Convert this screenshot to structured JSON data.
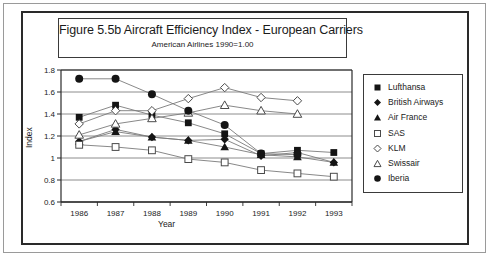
{
  "figure": {
    "title": "Figure 5.5b  Aircraft Efficiency Index - European Carriers",
    "subtitle": "American Airlines 1990=1.00"
  },
  "axes": {
    "ylabel": "Index",
    "xlabel": "Year",
    "yticks": [
      "1.8",
      "1.6",
      "1.4",
      "1.2",
      "1",
      "0.8",
      "0.6"
    ],
    "xticks": [
      "1986",
      "1987",
      "1988",
      "1989",
      "1990",
      "1991",
      "1992",
      "1993"
    ]
  },
  "legend": {
    "items": [
      {
        "label": "Lufthansa",
        "marker": "filled-square-marker"
      },
      {
        "label": "British Airways",
        "marker": "filled-diamond-marker"
      },
      {
        "label": "Air France",
        "marker": "filled-triangle-marker"
      },
      {
        "label": "SAS",
        "marker": "open-square-marker"
      },
      {
        "label": "KLM",
        "marker": "open-diamond-marker"
      },
      {
        "label": "Swissair",
        "marker": "open-triangle-marker"
      },
      {
        "label": "Iberia",
        "marker": "filled-circle-marker"
      }
    ]
  },
  "chart_data": {
    "type": "line",
    "title": "Figure 5.5b  Aircraft Efficiency Index - European Carriers",
    "subtitle": "American Airlines 1990=1.00",
    "xlabel": "Year",
    "ylabel": "Index",
    "categories": [
      1986,
      1987,
      1988,
      1989,
      1990,
      1991,
      1992,
      1993
    ],
    "ylim": [
      0.6,
      1.8
    ],
    "ytick_step": 0.2,
    "grid": "horizontal",
    "legend_position": "right",
    "series": [
      {
        "name": "Lufthansa",
        "marker": "filled-square",
        "values": [
          1.37,
          1.48,
          1.39,
          1.32,
          1.22,
          1.04,
          1.07,
          1.05
        ]
      },
      {
        "name": "British Airways",
        "marker": "filled-diamond",
        "values": [
          1.15,
          1.26,
          1.19,
          1.16,
          1.17,
          1.02,
          1.05,
          0.96
        ]
      },
      {
        "name": "Air France",
        "marker": "filled-triangle",
        "values": [
          1.15,
          1.24,
          1.19,
          1.16,
          1.1,
          1.03,
          1.01,
          0.96
        ]
      },
      {
        "name": "SAS",
        "marker": "open-square",
        "values": [
          1.12,
          1.1,
          1.07,
          0.99,
          0.96,
          0.89,
          0.86,
          0.83
        ]
      },
      {
        "name": "KLM",
        "marker": "open-diamond",
        "values": [
          1.31,
          1.43,
          1.43,
          1.54,
          1.64,
          1.55,
          1.52,
          null
        ]
      },
      {
        "name": "Swissair",
        "marker": "open-triangle",
        "values": [
          1.21,
          1.31,
          1.36,
          1.41,
          1.48,
          1.43,
          1.4,
          null
        ]
      },
      {
        "name": "Iberia",
        "marker": "filled-circle",
        "values": [
          1.72,
          1.72,
          1.58,
          1.43,
          1.3,
          1.04,
          1.03,
          null
        ]
      }
    ]
  },
  "colors": {
    "ink": "#1b1b1b",
    "frame": "#2a2a2a",
    "grid": "#6f6f6f",
    "line": "#7b7b7b",
    "background": "#ffffff"
  }
}
